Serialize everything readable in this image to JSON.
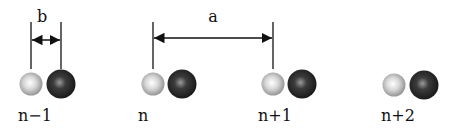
{
  "diagram": {
    "dimension_labels": {
      "b": "b",
      "a": "a"
    },
    "sites": [
      {
        "label": "n−1",
        "light_cx": 31,
        "dark_cx": 61
      },
      {
        "label": "n",
        "light_cx": 153,
        "dark_cx": 182
      },
      {
        "label": "n+1",
        "light_cx": 273,
        "dark_cx": 302
      },
      {
        "label": "n+2",
        "light_cx": 394,
        "dark_cx": 424
      }
    ],
    "colors": {
      "light_atom": "#c8c8c8",
      "dark_atom": "#2a2a2a",
      "line": "#111111"
    }
  }
}
